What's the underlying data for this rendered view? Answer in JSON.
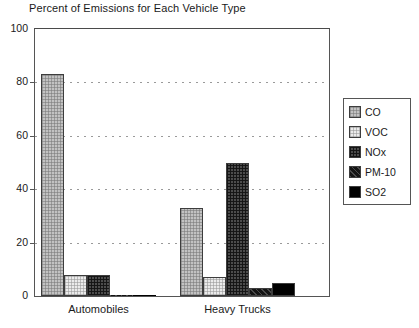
{
  "chart_data": {
    "type": "bar",
    "title": "Percent of Emissions for Each Vehicle Type",
    "xlabel": "",
    "ylabel": "",
    "categories": [
      "Automobiles",
      "Heavy Trucks"
    ],
    "series": [
      {
        "name": "CO",
        "values": [
          83,
          33
        ],
        "pattern": "light-gray-crosshatch",
        "color": "#c2c2c2"
      },
      {
        "name": "VOC",
        "values": [
          8,
          7
        ],
        "pattern": "very-light-dots",
        "color": "#ebebeb"
      },
      {
        "name": "NOx",
        "values": [
          8,
          50
        ],
        "pattern": "dark-grid",
        "color": "#4c4c4c"
      },
      {
        "name": "PM-10",
        "values": [
          0.3,
          3
        ],
        "pattern": "near-black-speckle",
        "color": "#141414"
      },
      {
        "name": "SO2",
        "values": [
          0.3,
          5
        ],
        "pattern": "solid-black",
        "color": "#000000"
      }
    ],
    "ylim": [
      0,
      100
    ],
    "yticks": [
      0,
      20,
      40,
      60,
      80,
      100
    ],
    "ytick_labels": [
      "0",
      "20",
      "40",
      "60",
      "80",
      "100"
    ],
    "grid": true,
    "grid_style": "dotted-horizontal",
    "legend_position": "right-outside",
    "legend_entries": [
      "CO",
      "VOC",
      "NOx",
      "PM-10",
      "SO2"
    ],
    "frame_color": "#555555",
    "text_color": "#1a1a1a"
  }
}
